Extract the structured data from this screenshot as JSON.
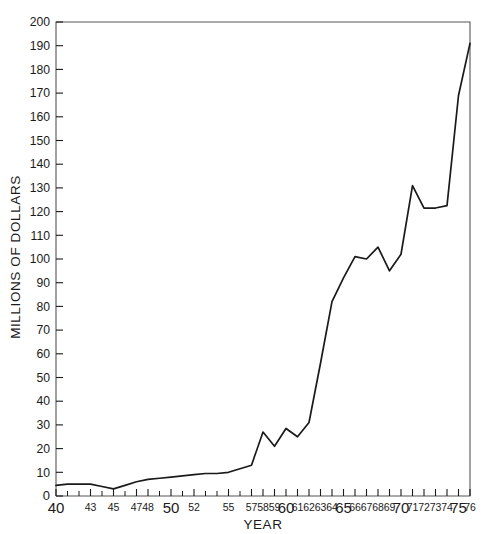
{
  "chart_data": {
    "type": "line",
    "title": "",
    "subtitle": "",
    "xlabel": "YEAR",
    "ylabel": "MILLIONS OF DOLLARS",
    "xlim": [
      40,
      76
    ],
    "ylim": [
      0,
      200
    ],
    "grid": false,
    "legend": null,
    "legend_position": "none",
    "line_color": "#1a1a1a",
    "frame_color": "#555555",
    "x_tick_labels": [
      "40",
      "43",
      "45",
      "47",
      "48",
      "50",
      "52",
      "55",
      "57",
      "58",
      "59",
      "60",
      "61",
      "62",
      "63",
      "64",
      "65",
      "66",
      "67",
      "68",
      "69",
      "70",
      "71",
      "72",
      "73",
      "74",
      "75",
      "76"
    ],
    "x_tick_emphasized": [
      "40",
      "50",
      "60",
      "65",
      "70",
      "75"
    ],
    "y_tick_labels": [
      "0",
      "10",
      "20",
      "30",
      "40",
      "50",
      "60",
      "70",
      "80",
      "90",
      "100",
      "110",
      "120",
      "130",
      "140",
      "150",
      "160",
      "170",
      "180",
      "190",
      "200"
    ],
    "y_tick_step": 10,
    "x": [
      40,
      41,
      42,
      43,
      44,
      45,
      46,
      47,
      48,
      49,
      50,
      51,
      52,
      53,
      54,
      55,
      56,
      57,
      58,
      59,
      60,
      61,
      62,
      63,
      64,
      65,
      66,
      67,
      68,
      69,
      70,
      71,
      72,
      73,
      74,
      75,
      76
    ],
    "values": [
      4.5,
      5,
      5,
      5,
      4,
      3,
      4.5,
      6,
      7,
      7.5,
      8,
      8.5,
      9,
      9.5,
      9.5,
      10,
      11.5,
      13,
      27,
      21,
      28.5,
      25,
      31,
      56,
      82,
      92,
      101,
      100,
      105,
      95,
      102,
      131,
      121.5,
      121.5,
      122.5,
      169,
      191
    ],
    "points": [
      {
        "x": 40,
        "y": 4.5
      },
      {
        "x": 41,
        "y": 5
      },
      {
        "x": 42,
        "y": 5
      },
      {
        "x": 43,
        "y": 5
      },
      {
        "x": 44,
        "y": 4
      },
      {
        "x": 45,
        "y": 3
      },
      {
        "x": 46,
        "y": 4.5
      },
      {
        "x": 47,
        "y": 6
      },
      {
        "x": 48,
        "y": 7
      },
      {
        "x": 49,
        "y": 7.5
      },
      {
        "x": 50,
        "y": 8
      },
      {
        "x": 51,
        "y": 8.5
      },
      {
        "x": 52,
        "y": 9
      },
      {
        "x": 53,
        "y": 9.5
      },
      {
        "x": 54,
        "y": 9.5
      },
      {
        "x": 55,
        "y": 10
      },
      {
        "x": 56,
        "y": 11.5
      },
      {
        "x": 57,
        "y": 13
      },
      {
        "x": 58,
        "y": 27
      },
      {
        "x": 59,
        "y": 21
      },
      {
        "x": 60,
        "y": 28.5
      },
      {
        "x": 61,
        "y": 25
      },
      {
        "x": 62,
        "y": 31
      },
      {
        "x": 63,
        "y": 56
      },
      {
        "x": 64,
        "y": 82
      },
      {
        "x": 65,
        "y": 92
      },
      {
        "x": 66,
        "y": 101
      },
      {
        "x": 67,
        "y": 100
      },
      {
        "x": 68,
        "y": 105
      },
      {
        "x": 69,
        "y": 95
      },
      {
        "x": 70,
        "y": 102
      },
      {
        "x": 71,
        "y": 131
      },
      {
        "x": 72,
        "y": 121.5
      },
      {
        "x": 73,
        "y": 121.5
      },
      {
        "x": 74,
        "y": 122.5
      },
      {
        "x": 75,
        "y": 169
      },
      {
        "x": 76,
        "y": 191
      }
    ]
  }
}
